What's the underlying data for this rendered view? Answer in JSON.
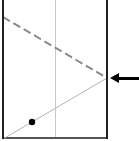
{
  "figure": {
    "name": "wave-reflection-diagram",
    "width": 139,
    "height": 141,
    "background_color": "#ffffff"
  },
  "colors": {
    "boundary_dark": "#222222",
    "center_line_light": "#c9c9c9",
    "dashed_line": "#8a8a8a",
    "solid_ray": "#b4b4b4",
    "baseline": "#555555",
    "marker_fill": "#000000",
    "arrow": "#000000"
  },
  "elements": {
    "left_boundary": {
      "label": "left-boundary-line",
      "x": 3,
      "y1": 0,
      "y2": 139,
      "stroke_width": 2,
      "style": "solid"
    },
    "center_line": {
      "label": "center-vertical-line",
      "x": 55,
      "y1": 0,
      "y2": 139,
      "stroke_width": 1,
      "style": "solid"
    },
    "right_boundary": {
      "label": "right-boundary-line",
      "x": 107,
      "y1": 0,
      "y2": 139,
      "stroke_width": 2,
      "style": "solid"
    },
    "baseline": {
      "label": "bottom-baseline",
      "x1": 3,
      "x2": 108,
      "y": 138,
      "stroke_width": 2,
      "style": "solid"
    },
    "dashed_ray": {
      "label": "incoming-dashed-ray",
      "x1": 3,
      "y1": 17,
      "x2": 107,
      "y2": 78,
      "stroke_width": 2,
      "style": "dashed",
      "dash_length": 8,
      "gap_length": 4
    },
    "solid_ray": {
      "label": "outgoing-solid-ray",
      "x1": 3,
      "y1": 139,
      "x2": 107,
      "y2": 78,
      "stroke_width": 1,
      "style": "solid"
    },
    "point_marker": {
      "label": "point-marker-on-solid-ray",
      "cx": 32,
      "cy": 122,
      "radius": 3.2
    },
    "arrow": {
      "label": "left-pointing-arrow",
      "tip_x": 110,
      "tail_x": 139,
      "y": 78,
      "shaft_width": 3,
      "head_length": 9,
      "head_half_height": 5,
      "direction": "left"
    }
  }
}
